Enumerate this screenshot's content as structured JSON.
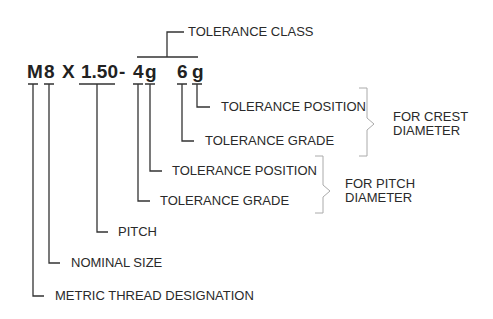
{
  "designation": {
    "parts": [
      {
        "id": "m",
        "text": "M"
      },
      {
        "id": "size",
        "text": "8"
      },
      {
        "id": "x",
        "text": "X"
      },
      {
        "id": "pitch",
        "text": "1.50"
      },
      {
        "id": "dash",
        "text": "-"
      },
      {
        "id": "pitch_grade",
        "text": "4"
      },
      {
        "id": "pitch_pos",
        "text": "g"
      },
      {
        "id": "crest_grade",
        "text": "6"
      },
      {
        "id": "crest_pos",
        "text": "g"
      }
    ]
  },
  "labels": {
    "tolerance_class": "TOLERANCE CLASS",
    "crest_tolerance_position": "TOLERANCE POSITION",
    "crest_tolerance_grade": "TOLERANCE GRADE",
    "pitch_tolerance_position": "TOLERANCE POSITION",
    "pitch_tolerance_grade": "TOLERANCE GRADE",
    "pitch": "PITCH",
    "nominal_size": "NOMINAL SIZE",
    "metric_thread_designation": "METRIC THREAD DESIGNATION"
  },
  "groups": {
    "crest_line1": "FOR CREST",
    "crest_line2": "DIAMETER",
    "pitch_line1": "FOR PITCH",
    "pitch_line2": "DIAMETER"
  },
  "colors": {
    "line": "#333333",
    "bracket": "#aaaaaa",
    "text": "#222222"
  }
}
